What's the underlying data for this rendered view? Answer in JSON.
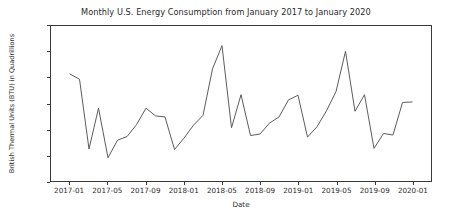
{
  "chart_data": {
    "type": "line",
    "title": "Monthly U.S. Energy Consumption from January 2017 to January 2020",
    "xlabel": "Date",
    "ylabel": "British Thermal Units (BTU) in Quadrillions",
    "ylim": [
      7.0,
      10.0
    ],
    "yticks": [
      "7.0",
      "7.5",
      "8.0",
      "8.5",
      "9.0",
      "9.5",
      "10.0"
    ],
    "ytick_values": [
      7.0,
      7.5,
      8.0,
      8.5,
      9.0,
      9.5,
      10.0
    ],
    "xticks": [
      "2017-01",
      "2017-05",
      "2017-09",
      "2018-01",
      "2018-05",
      "2018-09",
      "2019-01",
      "2019-05",
      "2019-09",
      "2020-01"
    ],
    "xtick_values": [
      "2017-01",
      "2017-05",
      "2017-09",
      "2018-01",
      "2018-05",
      "2018-09",
      "2019-01",
      "2019-05",
      "2019-09",
      "2020-01"
    ],
    "xlim": [
      "2016-11",
      "2020-03"
    ],
    "grid": false,
    "legend": false,
    "line_color": "#5a5a5a",
    "line_width": 1.0,
    "x": [
      "2017-01",
      "2017-02",
      "2017-03",
      "2017-04",
      "2017-05",
      "2017-06",
      "2017-07",
      "2017-08",
      "2017-09",
      "2017-10",
      "2017-11",
      "2017-12",
      "2018-01",
      "2018-02",
      "2018-03",
      "2018-04",
      "2018-05",
      "2018-06",
      "2018-07",
      "2018-08",
      "2018-09",
      "2018-10",
      "2018-11",
      "2018-12",
      "2019-01",
      "2019-02",
      "2019-03",
      "2019-04",
      "2019-05",
      "2019-06",
      "2019-07",
      "2019-08",
      "2019-09",
      "2019-10",
      "2019-11",
      "2019-12",
      "2020-01"
    ],
    "values": [
      9.07,
      8.97,
      7.62,
      8.41,
      7.45,
      7.79,
      7.86,
      8.09,
      8.41,
      8.26,
      8.24,
      7.61,
      7.83,
      8.08,
      8.27,
      9.17,
      9.62,
      8.03,
      8.67,
      7.88,
      7.91,
      8.12,
      8.24,
      8.57,
      8.66,
      7.85,
      8.05,
      8.36,
      8.73,
      9.51,
      8.35,
      8.67,
      7.63,
      7.92,
      7.89,
      8.52,
      8.53
    ],
    "series_name": "U.S. Energy Consumption"
  },
  "figure": {
    "background": "#ffffff",
    "axes_color": "#3a3a3a"
  }
}
